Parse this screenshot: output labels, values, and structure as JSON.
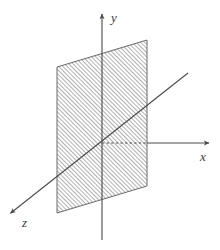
{
  "figure": {
    "background_color": "#ffffff",
    "line_color": "#4a4a4a",
    "hatch_color": "#6e6e6e",
    "label_color": "#3b3b3b"
  },
  "axes": [
    {
      "id": "y",
      "label": "y",
      "label_x": 111,
      "label_y": 22,
      "start_x": 102,
      "start_y": 240,
      "end_x": 102,
      "end_y": 12,
      "arrow": true,
      "style": "solid"
    },
    {
      "id": "x",
      "label": "x",
      "label_x": 200,
      "label_y": 161,
      "start_x": 102,
      "start_y": 143,
      "end_x": 211,
      "end_y": 143,
      "arrow": true,
      "style": "solid-outside-dashed-inside",
      "dash_from_x": 102,
      "dash_to_x": 147
    },
    {
      "id": "z",
      "label": "z",
      "label_x": 22,
      "label_y": 227,
      "start_x": 188,
      "start_y": 73,
      "end_x": 12,
      "end_y": 212,
      "arrow": true,
      "style": "solid"
    }
  ],
  "plane": {
    "name": "hatched-plane",
    "corners": [
      {
        "x": 57,
        "y": 67
      },
      {
        "x": 147,
        "y": 40
      },
      {
        "x": 147,
        "y": 186
      },
      {
        "x": 57,
        "y": 213
      }
    ],
    "hatch_angle_deg": 45,
    "hatch_spacing_px": 2,
    "fill": "none",
    "stroke": "#6a6a6a"
  },
  "origin": {
    "x": 102,
    "y": 143
  }
}
